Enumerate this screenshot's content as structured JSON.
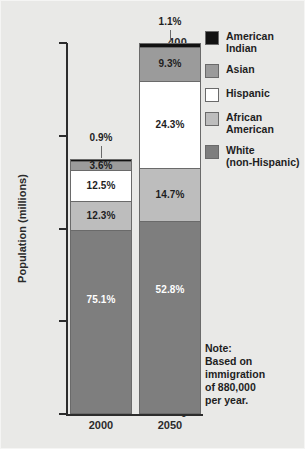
{
  "figure": {
    "background_color": "#e9e9e7"
  },
  "axis": {
    "y_title": "Population (millions)",
    "y_ticks": [
      "400",
      "300",
      "200",
      "100",
      "0"
    ],
    "y_tick_values": [
      400,
      300,
      200,
      100,
      0
    ]
  },
  "legend": {
    "items": [
      {
        "label": "American\nIndian",
        "color": "#111111",
        "key": "american-indian"
      },
      {
        "label": "Asian",
        "color": "#9b9b9b",
        "key": "asian"
      },
      {
        "label": "Hispanic",
        "color": "#ffffff",
        "key": "hispanic"
      },
      {
        "label": "African\nAmerican",
        "color": "#bdbdbd",
        "key": "african-american"
      },
      {
        "label": "White\n(non-Hispanic)",
        "color": "#7e7e7e",
        "key": "white-non-hispanic"
      }
    ]
  },
  "note": {
    "text": "Note:\nBased on\nimmigration\nof 880,000\nper year."
  },
  "chart_data": {
    "type": "bar",
    "subtype": "stacked",
    "title": "",
    "xlabel": "",
    "ylabel": "Population (millions)",
    "ylim": [
      0,
      400
    ],
    "grid": false,
    "legend_position": "right",
    "categories": [
      "2000",
      "2050"
    ],
    "totals": [
      275,
      400
    ],
    "series": [
      {
        "name": "White (non-Hispanic)",
        "color": "#7e7e7e",
        "label_color": "light",
        "values": [
          206.5,
          211.2
        ],
        "percent_labels": [
          "75.1%",
          "52.8%"
        ],
        "percents": [
          75.1,
          52.8
        ]
      },
      {
        "name": "African American",
        "color": "#bdbdbd",
        "label_color": "dark",
        "values": [
          33.8,
          58.8
        ],
        "percent_labels": [
          "12.3%",
          "14.7%"
        ],
        "percents": [
          12.3,
          14.7
        ]
      },
      {
        "name": "Hispanic",
        "color": "#ffffff",
        "label_color": "dark",
        "values": [
          34.4,
          97.2
        ],
        "percent_labels": [
          "12.5%",
          "24.3%"
        ],
        "percents": [
          12.5,
          24.3
        ]
      },
      {
        "name": "Asian",
        "color": "#9b9b9b",
        "label_color": "dark",
        "values": [
          9.9,
          37.2
        ],
        "percent_labels": [
          "3.6%",
          "9.3%"
        ],
        "percents": [
          3.6,
          9.3
        ]
      },
      {
        "name": "American Indian",
        "color": "#111111",
        "label_color": "dark",
        "values": [
          2.5,
          4.4
        ],
        "percent_labels": [
          "0.9%",
          "1.1%"
        ],
        "percents": [
          0.9,
          1.1
        ],
        "label_placement": "callout"
      }
    ]
  }
}
